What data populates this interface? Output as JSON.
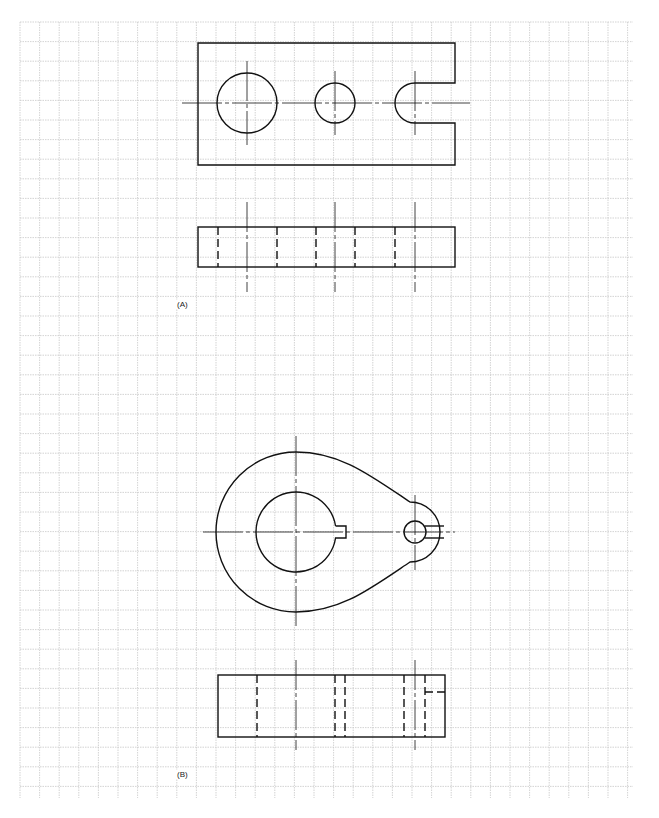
{
  "figure": {
    "grid": {
      "x0": 20,
      "y0": 22,
      "x1": 633,
      "y1": 798,
      "spacing": 19.6,
      "color": "#c8c8c8"
    },
    "line_color": "#111111",
    "labels": {
      "a": "(A)",
      "b": "(B)"
    },
    "drawing_a": {
      "top_view": {
        "rect": [
          198,
          43,
          455,
          165
        ],
        "holes": [
          {
            "cx": 247,
            "cy": 103,
            "r": 30
          },
          {
            "cx": 335,
            "cy": 103,
            "r": 20
          }
        ],
        "slot": {
          "cx": 415,
          "cy": 103,
          "r": 20,
          "end_x": 455
        }
      },
      "front_view": {
        "rect": [
          198,
          227,
          455,
          267
        ],
        "hidden_x": [
          218,
          277,
          316,
          355,
          395
        ],
        "center_x": [
          247,
          335,
          415
        ]
      }
    },
    "drawing_b": {
      "top_view": {
        "big": {
          "cx": 296,
          "cy": 532,
          "r": 80
        },
        "bore": {
          "cx": 296,
          "cy": 532,
          "r": 40
        },
        "keyway": {
          "x": 346,
          "h": 12
        },
        "small_hole": {
          "cx": 415,
          "cy": 532,
          "r": 11
        },
        "end": {
          "cx": 415,
          "cy": 532,
          "r": 30
        }
      },
      "front_view": {
        "rect": [
          218,
          675,
          445,
          737
        ],
        "hidden_x": [
          257,
          335,
          345,
          404,
          425
        ],
        "center_x": [
          296,
          415
        ]
      }
    }
  }
}
